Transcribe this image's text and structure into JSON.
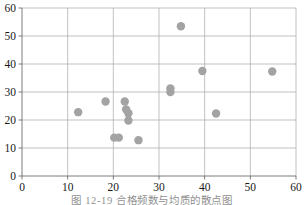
{
  "chart_data": {
    "type": "scatter",
    "title": "",
    "xlabel": "",
    "ylabel": "",
    "xlim": [
      0,
      60
    ],
    "ylim": [
      0,
      60
    ],
    "xticks": [
      0,
      10,
      20,
      30,
      40,
      50,
      60
    ],
    "yticks": [
      0,
      10,
      20,
      30,
      40,
      50,
      60
    ],
    "xtick_labels": [
      "0",
      "10",
      "20",
      "30",
      "40",
      "50",
      "60"
    ],
    "ytick_labels": [
      "0",
      "10",
      "20",
      "30",
      "40",
      "50",
      "60"
    ],
    "grid": true,
    "grid_axis": "both",
    "legend": false,
    "marker_color": "#a3a3a3",
    "marker_size": 4.2,
    "points": [
      {
        "x": 12.3,
        "y": 22.8
      },
      {
        "x": 18.3,
        "y": 26.6
      },
      {
        "x": 20.2,
        "y": 13.7
      },
      {
        "x": 21.2,
        "y": 13.7
      },
      {
        "x": 22.5,
        "y": 26.6
      },
      {
        "x": 22.8,
        "y": 23.8
      },
      {
        "x": 23.3,
        "y": 22.4
      },
      {
        "x": 23.3,
        "y": 19.8
      },
      {
        "x": 25.5,
        "y": 12.8
      },
      {
        "x": 32.5,
        "y": 31.3
      },
      {
        "x": 32.5,
        "y": 30.0
      },
      {
        "x": 34.8,
        "y": 53.5
      },
      {
        "x": 39.5,
        "y": 37.5
      },
      {
        "x": 42.5,
        "y": 22.3
      },
      {
        "x": 54.8,
        "y": 37.3
      }
    ]
  },
  "caption": {
    "text": "图 12-19  合格频数与均质的散点图"
  },
  "colors": {
    "marker": "#a3a3a3",
    "grid": "#a8a8a8",
    "axis": "#6e6e6e",
    "text": "#1a1a1a",
    "background": "#ffffff"
  }
}
